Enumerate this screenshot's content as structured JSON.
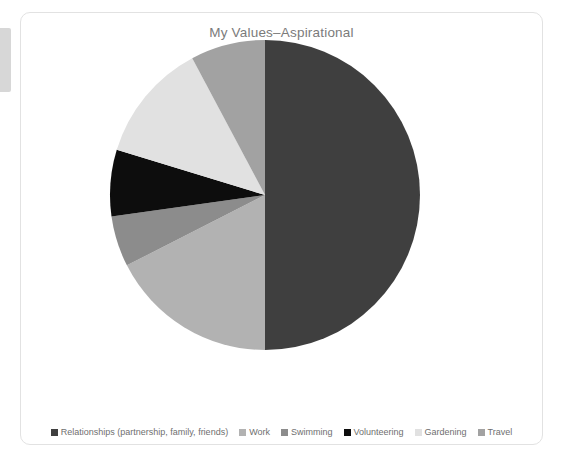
{
  "card": {
    "title": "My Values–Aspirational"
  },
  "chart_data": {
    "type": "pie",
    "title": "My Values–Aspirational",
    "xlabel": "",
    "ylabel": "",
    "grid": false,
    "legend_position": "bottom",
    "start_angle_deg": 0,
    "direction": "clockwise",
    "labels": [
      "Relationships (partnership, family, friends)",
      "Work",
      "Swimming",
      "Volunteering",
      "Gardening",
      "Travel"
    ],
    "values": [
      50,
      17.5,
      5.3,
      7,
      12.5,
      7.7
    ],
    "colors": [
      "#3f3f3f",
      "#b2b2b2",
      "#8c8c8c",
      "#0d0d0d",
      "#e1e1e1",
      "#a2a2a2"
    ],
    "slices": [
      {
        "label": "Relationships (partnership, family, friends)",
        "value": 50,
        "color": "#3f3f3f",
        "start_deg": 0,
        "end_deg": 180
      },
      {
        "label": "Work",
        "value": 17.5,
        "color": "#b2b2b2",
        "start_deg": 180,
        "end_deg": 243
      },
      {
        "label": "Swimming",
        "value": 5.3,
        "color": "#8c8c8c",
        "start_deg": 243,
        "end_deg": 262
      },
      {
        "label": "Volunteering",
        "value": 7,
        "color": "#0d0d0d",
        "start_deg": 262,
        "end_deg": 287
      },
      {
        "label": "Gardening",
        "value": 12.5,
        "color": "#e1e1e1",
        "start_deg": 287,
        "end_deg": 332
      },
      {
        "label": "Travel",
        "value": 7.7,
        "color": "#a2a2a2",
        "start_deg": 332,
        "end_deg": 360
      }
    ]
  },
  "legend": {
    "items": [
      {
        "label": "Relationships (partnership, family, friends)",
        "color": "#3f3f3f"
      },
      {
        "label": "Work",
        "color": "#b2b2b2"
      },
      {
        "label": "Swimming",
        "color": "#8c8c8c"
      },
      {
        "label": "Volunteering",
        "color": "#0d0d0d"
      },
      {
        "label": "Gardening",
        "color": "#e1e1e1"
      },
      {
        "label": "Travel",
        "color": "#a2a2a2"
      }
    ]
  },
  "theme": {
    "page_background": "#ffffff",
    "card_background": "#ffffff",
    "card_border": "#e2e2e2",
    "title_color": "#7b7b7b",
    "legend_text_color": "#6f6f6f",
    "edge_strip_color": "#d7d7d7"
  }
}
